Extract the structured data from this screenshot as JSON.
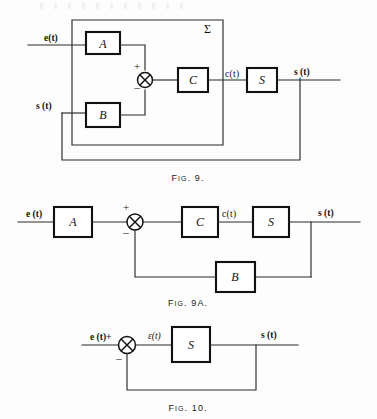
{
  "page": {
    "width": 377,
    "height": 419,
    "background": "#fdfdfd",
    "ink": "#111111"
  },
  "figures": [
    {
      "id": "fig9",
      "caption_main": "F",
      "caption_small": "IG",
      "caption_rest": ". 9.",
      "caption": "FIG. 9.",
      "blocks": [
        {
          "name": "A",
          "label": "A"
        },
        {
          "name": "B",
          "label": "B"
        },
        {
          "name": "C",
          "label": "C"
        },
        {
          "name": "S",
          "label": "S"
        }
      ],
      "signals": {
        "input_e": "e(t)",
        "input_s": "s (t)",
        "mid_c": "c(t)",
        "output_s": "s (t)"
      },
      "summer": {
        "plus": "+",
        "minus": "–"
      },
      "envelope_label": "Σ"
    },
    {
      "id": "fig9a",
      "caption_main": "F",
      "caption_small": "IG",
      "caption_rest": ". 9A.",
      "caption": "FIG. 9A.",
      "blocks": [
        {
          "name": "A",
          "label": "A"
        },
        {
          "name": "C",
          "label": "C"
        },
        {
          "name": "S",
          "label": "S"
        },
        {
          "name": "B",
          "label": "B"
        }
      ],
      "signals": {
        "input_e": "e (t)",
        "mid_c": "c(t)",
        "output_s": "s (t)"
      },
      "summer": {
        "plus": "+",
        "minus": "–"
      }
    },
    {
      "id": "fig10",
      "caption_main": "F",
      "caption_small": "IG",
      "caption_rest": ". 10.",
      "caption": "FIG. 10.",
      "blocks": [
        {
          "name": "S",
          "label": "S"
        }
      ],
      "signals": {
        "input_e": "e (t)+",
        "error_eps": "ε(t)",
        "output_s": "s (t)"
      },
      "summer": {
        "plus": "",
        "minus": "–"
      }
    }
  ]
}
